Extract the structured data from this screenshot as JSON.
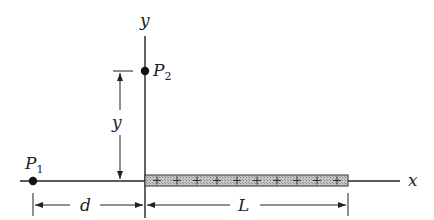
{
  "diagram": {
    "axes": {
      "x_label": "x",
      "y_label": "y"
    },
    "points": [
      {
        "name": "P",
        "subscript": "1"
      },
      {
        "name": "P",
        "subscript": "2"
      }
    ],
    "dimensions": {
      "d": "d",
      "L": "L",
      "y": "y"
    },
    "rod": {
      "charge_sign": "+",
      "charge_count": 10,
      "fill": "#b8b8b8"
    }
  }
}
